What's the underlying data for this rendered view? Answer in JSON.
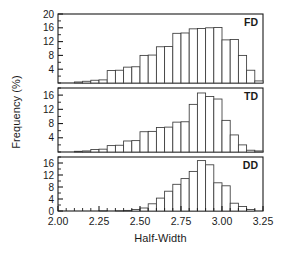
{
  "chart_data": {
    "type": "bar",
    "title": "",
    "xlabel": "Half-Width",
    "ylabel": "Frequency (%)",
    "xlim": [
      2.0,
      3.25
    ],
    "xticks": [
      2.0,
      2.25,
      2.5,
      2.75,
      3.0,
      3.25
    ],
    "xtick_labels": [
      "2.00",
      "2.25",
      "2.50",
      "2.75",
      "3.00",
      "3.25"
    ],
    "grid": false,
    "legend_position": "none",
    "bin_width": 0.05,
    "bin_edges": [
      2.0,
      2.05,
      2.1,
      2.15,
      2.2,
      2.25,
      2.3,
      2.35,
      2.4,
      2.45,
      2.5,
      2.55,
      2.6,
      2.65,
      2.7,
      2.75,
      2.8,
      2.85,
      2.9,
      2.95,
      3.0,
      3.05,
      3.1,
      3.15,
      3.2,
      3.25
    ],
    "bin_centers": [
      2.025,
      2.075,
      2.125,
      2.175,
      2.225,
      2.275,
      2.325,
      2.375,
      2.425,
      2.475,
      2.525,
      2.575,
      2.625,
      2.675,
      2.725,
      2.775,
      2.825,
      2.875,
      2.925,
      2.975,
      3.025,
      3.075,
      3.125,
      3.175,
      3.225
    ],
    "panels": [
      {
        "label": "FD",
        "ylim": [
          0,
          20
        ],
        "yticks": [
          4,
          8,
          12,
          16,
          20
        ],
        "ytick_labels": [
          "4",
          "8",
          "12",
          "16",
          "20"
        ],
        "values": [
          0,
          0,
          0.3,
          0.5,
          0.8,
          0.9,
          3.6,
          3.7,
          4.6,
          4.7,
          8.0,
          8.1,
          10.5,
          10.6,
          14.4,
          14.5,
          15.7,
          15.8,
          16.0,
          16.1,
          12.5,
          12.6,
          8.0,
          3.7,
          0.6
        ]
      },
      {
        "label": "TD",
        "ylim": [
          0,
          18
        ],
        "yticks": [
          4,
          8,
          12,
          16
        ],
        "ytick_labels": [
          "4",
          "8",
          "12",
          "16"
        ],
        "values": [
          0,
          0,
          0.2,
          0.3,
          0.7,
          0.8,
          1.8,
          1.9,
          3.1,
          3.2,
          5.7,
          5.8,
          6.9,
          7.0,
          8.4,
          8.5,
          13.4,
          16.6,
          15.6,
          14.9,
          8.9,
          4.8,
          2.0,
          0.5,
          0.3
        ]
      },
      {
        "label": "DD",
        "ylim": [
          0,
          18
        ],
        "yticks": [
          0,
          4,
          8,
          12,
          16
        ],
        "ytick_labels": [
          "0",
          "4",
          "8",
          "12",
          "16"
        ],
        "values": [
          0,
          0,
          0,
          0,
          0,
          0.1,
          0,
          0.1,
          0.2,
          0.5,
          1.0,
          2.4,
          4.3,
          6.6,
          8.9,
          10.8,
          13.2,
          16.8,
          15.4,
          9.4,
          8.4,
          2.6,
          1.5,
          0.5,
          0
        ]
      }
    ]
  }
}
